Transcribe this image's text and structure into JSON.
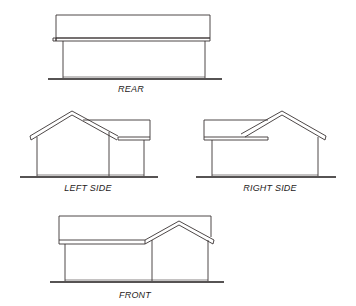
{
  "drawing": {
    "line_color": "#3a3333",
    "ground_color": "#1e1a1a",
    "background": "#ffffff",
    "elevations": [
      {
        "id": "rear",
        "label": "REAR"
      },
      {
        "id": "left-side",
        "label": "LEFT SIDE"
      },
      {
        "id": "right-side",
        "label": "RIGHT SIDE"
      },
      {
        "id": "front",
        "label": "FRONT"
      }
    ]
  }
}
